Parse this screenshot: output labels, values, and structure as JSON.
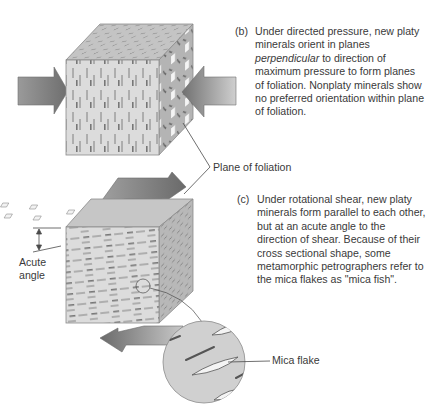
{
  "figure": {
    "captions": {
      "b": {
        "letter": "(b)",
        "text_before": "Under directed pressure, new platy minerals orient in planes ",
        "text_emphasis": "perpendicular",
        "text_after": " to direction of maximum pressure to form planes of foliation.  Nonplaty minerals show no preferred orientation within plane of foliation."
      },
      "c": {
        "letter": "(c)",
        "text": "Under rotational shear, new platy minerals form parallel to each other, but at an acute angle to the direction of shear.  Because of their cross sectional shape, some metamorphic petrographers refer to the mica flakes as \"mica fish\"."
      }
    },
    "labels": {
      "plane_of_foliation": "Plane of foliation",
      "acute_angle": "Acute angle",
      "mica_flake": "Mica flake"
    },
    "colors": {
      "front_face": "#dcdcdc",
      "top_face": "#c4c4c4",
      "side_face": "#b2b2b2",
      "arrow_dark": "#7a7a7a",
      "arrow_light": "#c8c8c8",
      "line": "#4a4a4a",
      "lens": "#cfcfcf"
    }
  }
}
